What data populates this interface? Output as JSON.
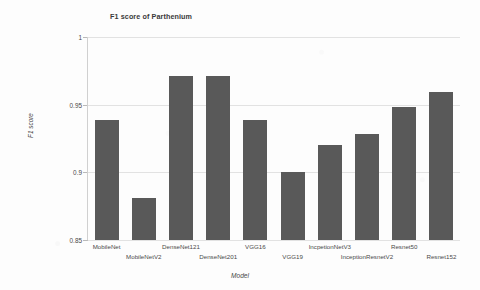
{
  "chart_data": {
    "type": "bar",
    "title": "F1 score of Parthenium",
    "xlabel": "Model",
    "ylabel": "F1 score",
    "categories": [
      "MobileNet",
      "MobileNetV2",
      "DenseNet121",
      "DenseNet201",
      "VGG16",
      "VGG19",
      "IncpetionNetV3",
      "InceptionResnetV2",
      "Resnet50",
      "Resnet152"
    ],
    "values": [
      0.939,
      0.881,
      0.971,
      0.971,
      0.939,
      0.9,
      0.92,
      0.928,
      0.948,
      0.959
    ],
    "ylim": [
      0.85,
      1.0
    ],
    "yticks": [
      "0.85",
      "0.9",
      "0.95",
      "1"
    ],
    "ytick_values": [
      0.85,
      0.9,
      0.95,
      1.0
    ],
    "grid": true,
    "legend": "none",
    "bar_color": "#595959",
    "grid_color": "#e2e2e2"
  }
}
